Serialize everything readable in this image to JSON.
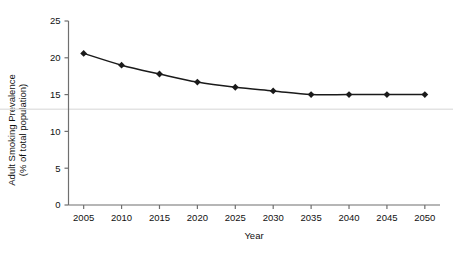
{
  "chart_data": {
    "type": "line",
    "title": "",
    "xlabel": "Year",
    "ylabel": "Adult Smoking Prevalence (% of total population)",
    "ylabel_lines": [
      "Adult Smoking Prevalence",
      "(% of total population)"
    ],
    "x": [
      2005,
      2010,
      2015,
      2020,
      2025,
      2030,
      2035,
      2040,
      2045,
      2050
    ],
    "values": [
      20.6,
      19.0,
      17.8,
      16.7,
      16.0,
      15.5,
      15.0,
      15.0,
      15.0,
      15.0
    ],
    "xtick_labels": [
      "2005",
      "2010",
      "2015",
      "2020",
      "2025",
      "2030",
      "2035",
      "2040",
      "2045",
      "2050"
    ],
    "ytick_labels": [
      "0",
      "5",
      "10",
      "15",
      "20",
      "25"
    ],
    "yticks": [
      0,
      5,
      10,
      15,
      20,
      25
    ],
    "ylim": [
      0,
      25
    ],
    "xlim": [
      2003,
      2052
    ],
    "grid": false,
    "reference_line": {
      "value": 13.0,
      "color": "#e3e3e3"
    },
    "legend": null,
    "marker": "diamond",
    "series_color": "#1a1a1a",
    "axis_color": "#6f6f6f"
  }
}
